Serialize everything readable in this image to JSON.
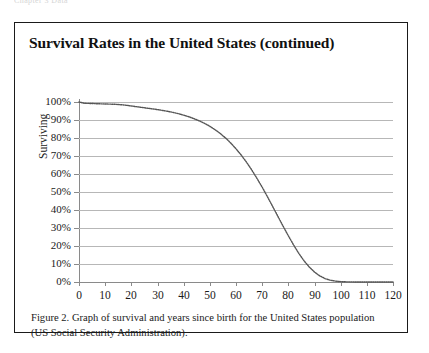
{
  "running_header": "Chapter 3  Data",
  "figure": {
    "title": "Survival Rates in the United States (continued)",
    "caption": "Figure 2. Graph of survival and years since birth for the United States population (US Social Security Administration).",
    "border_color": "#1a1a1a"
  },
  "axis_titles": {
    "y": "Surviving",
    "x": ""
  },
  "chart_data": {
    "type": "line",
    "title": "Survival Rates in the United States (continued)",
    "xlabel": "",
    "ylabel": "Surviving",
    "xlim": [
      0,
      120
    ],
    "ylim": [
      0,
      1
    ],
    "grid": true,
    "legend": "none",
    "line_color": "#555555",
    "line_style": "dotted",
    "xticks": [
      0,
      10,
      20,
      30,
      40,
      50,
      60,
      70,
      80,
      90,
      100,
      110,
      120
    ],
    "xtick_labels": [
      "0",
      "10",
      "20",
      "30",
      "40",
      "50",
      "60",
      "70",
      "80",
      "90",
      "100",
      "110",
      "120"
    ],
    "yticks": [
      0,
      0.1,
      0.2,
      0.3,
      0.4,
      0.5,
      0.6,
      0.7,
      0.8,
      0.9,
      1.0
    ],
    "ytick_labels": [
      "0%",
      "10%",
      "20%",
      "30%",
      "40%",
      "50%",
      "60%",
      "70%",
      "80%",
      "90%",
      "100%"
    ],
    "series": [
      {
        "name": "Surviving",
        "x": [
          0,
          2,
          4,
          6,
          8,
          10,
          12,
          14,
          16,
          18,
          20,
          22,
          24,
          26,
          28,
          30,
          32,
          34,
          36,
          38,
          40,
          42,
          44,
          46,
          48,
          50,
          52,
          54,
          56,
          58,
          60,
          62,
          64,
          66,
          68,
          70,
          72,
          74,
          76,
          78,
          80,
          82,
          84,
          86,
          88,
          90,
          92,
          94,
          96,
          98,
          100,
          102,
          104,
          106,
          108,
          110,
          112,
          114,
          116,
          118,
          120
        ],
        "values": [
          1.0,
          0.993,
          0.992,
          0.991,
          0.99,
          0.989,
          0.988,
          0.987,
          0.985,
          0.982,
          0.978,
          0.974,
          0.97,
          0.966,
          0.962,
          0.958,
          0.953,
          0.948,
          0.942,
          0.935,
          0.927,
          0.918,
          0.907,
          0.895,
          0.881,
          0.865,
          0.846,
          0.825,
          0.8,
          0.772,
          0.74,
          0.705,
          0.666,
          0.623,
          0.576,
          0.527,
          0.474,
          0.42,
          0.365,
          0.31,
          0.257,
          0.206,
          0.159,
          0.118,
          0.083,
          0.055,
          0.034,
          0.019,
          0.01,
          0.005,
          0.002,
          0.001,
          0.0005,
          0.0003,
          0.0002,
          0.0001,
          0.0001,
          0.0,
          0.0,
          0.0,
          0.0
        ]
      }
    ]
  }
}
